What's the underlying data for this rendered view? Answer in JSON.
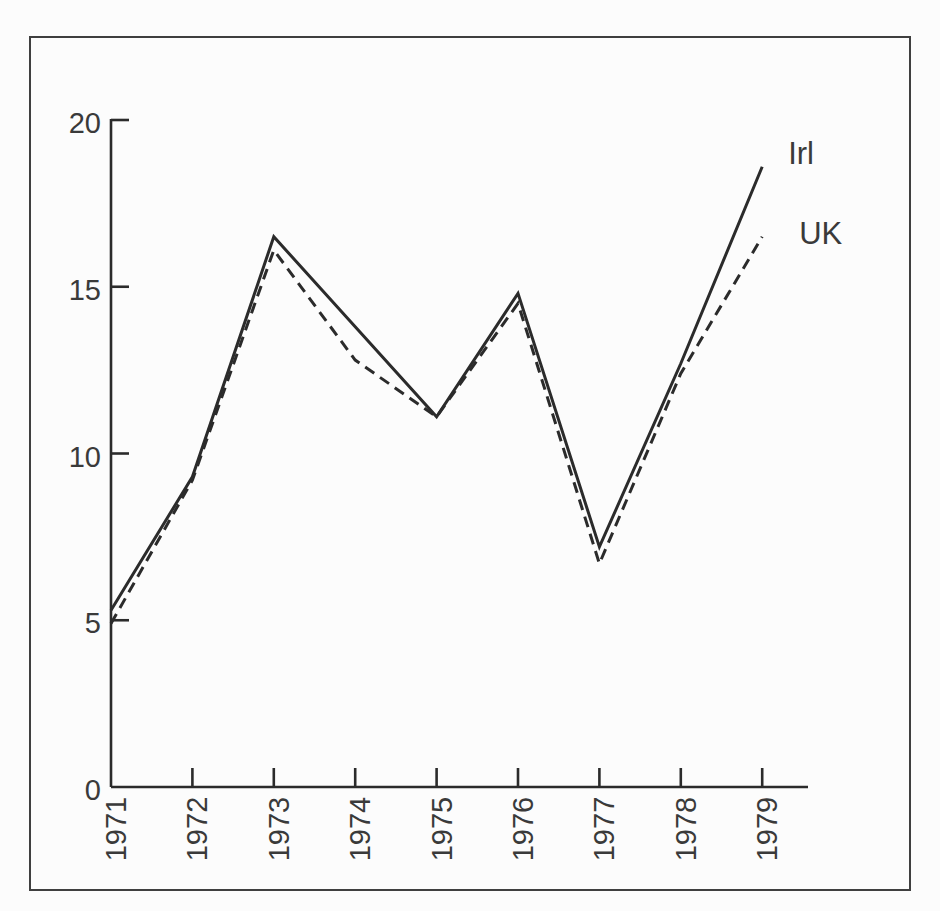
{
  "figure": {
    "background": "#fcfcfc",
    "frame_color": "#3f3f3f",
    "ink_color": "#2b2b2b",
    "text_color": "#3a3a3a"
  },
  "chart_data": {
    "type": "line",
    "title": "",
    "xlabel": "",
    "ylabel": "",
    "x": [
      "1971",
      "1972",
      "1973",
      "1974",
      "1975",
      "1976",
      "1977",
      "1978",
      "1979"
    ],
    "series": [
      {
        "name": "Irl",
        "style": "solid",
        "values": [
          5.3,
          9.3,
          16.5,
          13.8,
          11.1,
          14.8,
          7.2,
          12.7,
          18.6
        ]
      },
      {
        "name": "UK",
        "style": "dashed",
        "values": [
          4.9,
          9.2,
          16.1,
          12.8,
          11.1,
          14.5,
          6.7,
          12.4,
          16.5
        ]
      }
    ],
    "ylim": [
      0,
      20
    ],
    "yticks": [
      "0",
      "5",
      "10",
      "15",
      "20"
    ],
    "grid": false,
    "legend_position": "line-end-labels"
  }
}
